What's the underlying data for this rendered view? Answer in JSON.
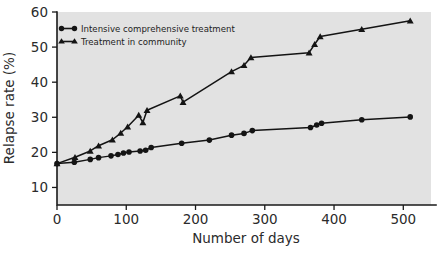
{
  "chart_data": {
    "type": "line",
    "title": "",
    "subtitle": "",
    "xlabel": "Number of days",
    "ylabel": "Relapse rate (%)",
    "xlim": [
      0,
      540
    ],
    "ylim": [
      5,
      60
    ],
    "xticks": [
      0,
      100,
      200,
      300,
      400,
      500
    ],
    "xtick_labels": [
      "0",
      "100",
      "200",
      "300",
      "400",
      "500"
    ],
    "yticks": [
      10,
      20,
      30,
      40,
      50,
      60
    ],
    "ytick_labels": [
      "10",
      "20",
      "30",
      "40",
      "50",
      "60"
    ],
    "grid": false,
    "legend_position": "upper left inside",
    "plot_background": "#e2e2e2",
    "line_color": "#141414",
    "series": [
      {
        "name": "Intensive comprehensive treatment",
        "marker": "circle",
        "color": "#141414",
        "points": [
          [
            0,
            16.8
          ],
          [
            25,
            17.2
          ],
          [
            48,
            18.0
          ],
          [
            60,
            18.5
          ],
          [
            78,
            19.0
          ],
          [
            88,
            19.4
          ],
          [
            96,
            19.8
          ],
          [
            104,
            20.1
          ],
          [
            120,
            20.4
          ],
          [
            128,
            20.6
          ],
          [
            136,
            21.4
          ],
          [
            180,
            22.6
          ],
          [
            220,
            23.5
          ],
          [
            252,
            24.9
          ],
          [
            270,
            25.4
          ],
          [
            282,
            26.2
          ],
          [
            366,
            27.1
          ],
          [
            375,
            27.8
          ],
          [
            382,
            28.3
          ],
          [
            440,
            29.3
          ],
          [
            510,
            30.1
          ]
        ]
      },
      {
        "name": "Treatment in community",
        "marker": "triangle",
        "color": "#141414",
        "points": [
          [
            0,
            16.8
          ],
          [
            26,
            18.6
          ],
          [
            48,
            20.4
          ],
          [
            60,
            21.9
          ],
          [
            80,
            23.6
          ],
          [
            92,
            25.5
          ],
          [
            102,
            27.3
          ],
          [
            118,
            30.6
          ],
          [
            124,
            28.5
          ],
          [
            130,
            32.0
          ],
          [
            178,
            36.1
          ],
          [
            182,
            34.3
          ],
          [
            252,
            43.0
          ],
          [
            270,
            44.8
          ],
          [
            280,
            47.0
          ],
          [
            364,
            48.4
          ],
          [
            372,
            50.8
          ],
          [
            380,
            53.0
          ],
          [
            440,
            55.1
          ],
          [
            510,
            57.5
          ]
        ]
      }
    ]
  },
  "legend": {
    "items": [
      {
        "label": "Intensive comprehensive treatment",
        "marker": "circle"
      },
      {
        "label": "Treatment in community",
        "marker": "triangle"
      }
    ]
  }
}
